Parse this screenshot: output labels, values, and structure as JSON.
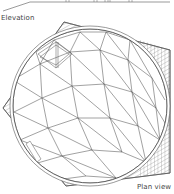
{
  "figure": {
    "type": "architectural drawing"
  },
  "labels": {
    "elevation": "Elevation",
    "plan_view": "Plan view"
  },
  "colors": {
    "line": "#555555",
    "hatch": "#777777",
    "text": "#444444",
    "background": "#ffffff"
  }
}
